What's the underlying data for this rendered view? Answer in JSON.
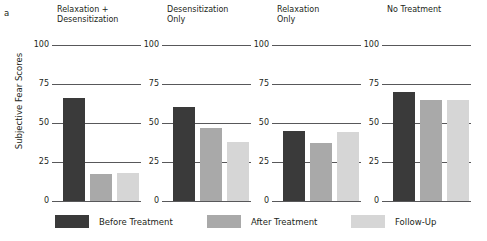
{
  "figure": {
    "panel_letter": "a",
    "y_axis_title": "Subjective Fear Scores"
  },
  "legend": {
    "items": [
      {
        "label": "Before Treatment",
        "color": "#3a3a3a",
        "key": "before"
      },
      {
        "label": "After Treatment",
        "color": "#a9a9a9",
        "key": "after"
      },
      {
        "label": "Follow-Up",
        "color": "#d6d6d6",
        "key": "follow"
      }
    ]
  },
  "axis": {
    "ticks": [
      "100",
      "75",
      "50",
      "25",
      "0"
    ],
    "tick_values": [
      100,
      75,
      50,
      25,
      0
    ]
  },
  "panels": [
    {
      "title": "Relaxation +\nDesensitization"
    },
    {
      "title": "Desensitization\nOnly"
    },
    {
      "title": "Relaxation\nOnly"
    },
    {
      "title": "No Treatment"
    }
  ],
  "chart_data": {
    "type": "bar",
    "title": "",
    "subtitle": "",
    "xlabel": "",
    "ylabel": "Subjective Fear Scores",
    "ylim": [
      0,
      100
    ],
    "yticks": [
      0,
      25,
      50,
      75,
      100
    ],
    "grid": "horizontal gridlines at 25, 50, 75, 100",
    "legend_position": "bottom",
    "panel_letter": "a",
    "categories": [
      "Relaxation + Desensitization",
      "Desensitization Only",
      "Relaxation Only",
      "No Treatment"
    ],
    "series": [
      {
        "name": "Before Treatment",
        "color": "#3a3a3a",
        "values": [
          66,
          60,
          45,
          70
        ]
      },
      {
        "name": "After Treatment",
        "color": "#a9a9a9",
        "values": [
          17,
          47,
          37,
          65
        ]
      },
      {
        "name": "Follow-Up",
        "color": "#d6d6d6",
        "values": [
          18,
          38,
          44,
          65
        ]
      }
    ]
  }
}
